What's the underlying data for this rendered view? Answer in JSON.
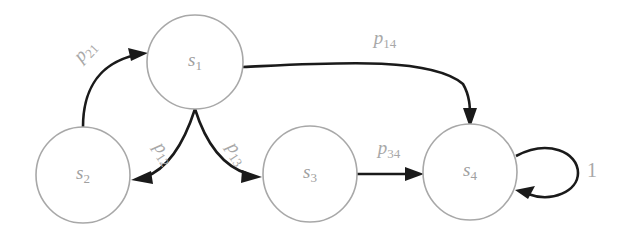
{
  "diagram": {
    "type": "state-transition-graph",
    "background_color": "#ffffff",
    "node_stroke_color": "#a8a8a8",
    "node_fill_color": "#ffffff",
    "label_color": "#a8a8a8",
    "edge_color": "#1a1a1a",
    "nodes": [
      {
        "id": "s1",
        "base": "s",
        "sub": "1",
        "cx": 195,
        "cy": 62,
        "rx": 48,
        "ry": 47
      },
      {
        "id": "s2",
        "base": "s",
        "sub": "2",
        "cx": 83,
        "cy": 175,
        "rx": 47,
        "ry": 48
      },
      {
        "id": "s3",
        "base": "s",
        "sub": "3",
        "cx": 310,
        "cy": 174,
        "rx": 47,
        "ry": 48
      },
      {
        "id": "s4",
        "base": "s",
        "sub": "4",
        "cx": 470,
        "cy": 172,
        "rx": 47,
        "ry": 48
      }
    ],
    "edges": [
      {
        "id": "p21",
        "from": "s2",
        "to": "s1",
        "base": "p",
        "sub": "21",
        "label_x": 86,
        "label_y": 52,
        "label_rotate": -47
      },
      {
        "id": "p14",
        "from": "s1",
        "to": "s4",
        "base": "p",
        "sub": "14",
        "label_x": 385,
        "label_y": 40,
        "label_rotate": 0
      },
      {
        "id": "p12",
        "from": "s1",
        "to": "s2",
        "base": "p",
        "sub": "12",
        "label_x": 163,
        "label_y": 154,
        "label_rotate": 56
      },
      {
        "id": "p13",
        "from": "s1",
        "to": "s3",
        "base": "p",
        "sub": "13",
        "label_x": 236,
        "label_y": 154,
        "label_rotate": 56
      },
      {
        "id": "p34",
        "from": "s3",
        "to": "s4",
        "base": "p",
        "sub": "34",
        "label_x": 389,
        "label_y": 150,
        "label_rotate": 0
      }
    ],
    "self_loops": [
      {
        "id": "loop-s4",
        "on": "s4",
        "label": "1",
        "label_x": 592,
        "label_y": 172
      }
    ]
  }
}
